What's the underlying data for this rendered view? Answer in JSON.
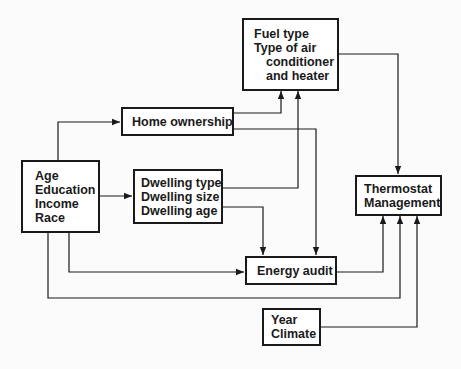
{
  "diagram": {
    "nodes": {
      "fuel": {
        "lines": [
          "Fuel type",
          "Type of air",
          "conditioner",
          "and heater"
        ]
      },
      "home_ownership": {
        "lines": [
          "Home ownership"
        ]
      },
      "demographics": {
        "lines": [
          "Age",
          "Education",
          "Income",
          "Race"
        ]
      },
      "dwelling": {
        "lines": [
          "Dwelling type",
          "Dwelling size",
          "Dwelling age"
        ]
      },
      "thermostat": {
        "lines": [
          "Thermostat",
          "Management"
        ]
      },
      "energy_audit": {
        "lines": [
          "Energy audit"
        ]
      },
      "year_climate": {
        "lines": [
          "Year",
          "Climate"
        ]
      }
    },
    "edges": [
      {
        "from": "demographics",
        "to": "home_ownership"
      },
      {
        "from": "demographics",
        "to": "dwelling"
      },
      {
        "from": "demographics",
        "to": "energy_audit"
      },
      {
        "from": "demographics",
        "to": "thermostat"
      },
      {
        "from": "home_ownership",
        "to": "fuel"
      },
      {
        "from": "home_ownership",
        "to": "energy_audit"
      },
      {
        "from": "dwelling",
        "to": "fuel"
      },
      {
        "from": "dwelling",
        "to": "energy_audit"
      },
      {
        "from": "fuel",
        "to": "thermostat"
      },
      {
        "from": "energy_audit",
        "to": "thermostat"
      },
      {
        "from": "year_climate",
        "to": "thermostat"
      }
    ],
    "colors": {
      "line": "#1a1a1a",
      "background": "#fbfbfb",
      "box_fill": "#ffffff"
    }
  }
}
